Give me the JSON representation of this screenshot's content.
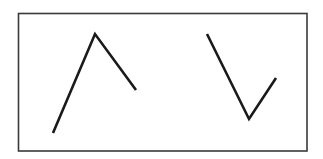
{
  "diagram": {
    "title": "",
    "colors": {
      "background": "#ffffff",
      "frame": "#3a3a3a",
      "stroke": "#1a1a1a"
    },
    "shapes": [
      {
        "id": "angle-left",
        "kind": "polyline",
        "label": "inverted-v-angle",
        "vertex": "apex-up"
      },
      {
        "id": "angle-right",
        "kind": "polyline",
        "label": "v-angle",
        "vertex": "apex-down"
      }
    ]
  }
}
